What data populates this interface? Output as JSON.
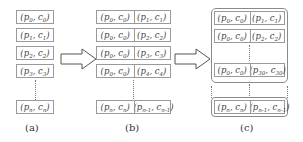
{
  "panel_a": {
    "cells": [
      {
        "p": "p",
        "ps": "0",
        "c": "c",
        "cs": "0"
      },
      {
        "p": "p",
        "ps": "1",
        "c": "c",
        "cs": "1"
      },
      {
        "p": "p",
        "ps": "2",
        "c": "c",
        "cs": "2"
      },
      {
        "p": "p",
        "ps": "3",
        "c": "c",
        "cs": "3"
      }
    ],
    "last": {
      "p": "p",
      "ps": "n",
      "c": "c",
      "cs": "n"
    },
    "label": "(a)"
  },
  "panel_b": {
    "rows": [
      [
        {
          "p": "p",
          "ps": "0",
          "c": "c",
          "cs": "0"
        },
        {
          "p": "p",
          "ps": "1",
          "c": "c",
          "cs": "1"
        }
      ],
      [
        {
          "p": "p",
          "ps": "0",
          "c": "c",
          "cs": "0"
        },
        {
          "p": "p",
          "ps": "2",
          "c": "c",
          "cs": "2"
        }
      ],
      [
        {
          "p": "p",
          "ps": "0",
          "c": "c",
          "cs": "0"
        },
        {
          "p": "p",
          "ps": "3",
          "c": "c",
          "cs": "3"
        }
      ],
      [
        {
          "p": "p",
          "ps": "0",
          "c": "c",
          "cs": "0"
        },
        {
          "p": "p",
          "ps": "4",
          "c": "c",
          "cs": "4"
        }
      ]
    ],
    "last": [
      {
        "p": "p",
        "ps": "n",
        "c": "c",
        "cs": "n"
      },
      {
        "p": "p",
        "ps": "n-1",
        "c": "c",
        "cs": "n-1"
      }
    ],
    "label": "(b)"
  },
  "panel_c": {
    "group_rows": [
      [
        {
          "p": "p",
          "ps": "0",
          "c": "c",
          "cs": "0"
        },
        {
          "p": "p",
          "ps": "1",
          "c": "c",
          "cs": "1"
        }
      ],
      [
        {
          "p": "p",
          "ps": "0",
          "c": "c",
          "cs": "0"
        },
        {
          "p": "p",
          "ps": "2",
          "c": "c",
          "cs": "2"
        }
      ],
      [
        {
          "p": "p",
          "ps": "0",
          "c": "c",
          "cs": "0"
        },
        {
          "p": "p",
          "ps": "30",
          "c": "c",
          "cs": "30"
        }
      ]
    ],
    "last": [
      {
        "p": "p",
        "ps": "n",
        "c": "c",
        "cs": "n"
      },
      {
        "p": "p",
        "ps": "n-1",
        "c": "c",
        "cs": "n-1"
      }
    ],
    "label": "(c)"
  },
  "arrows": [
    "transform-arrow-1",
    "transform-arrow-2"
  ]
}
